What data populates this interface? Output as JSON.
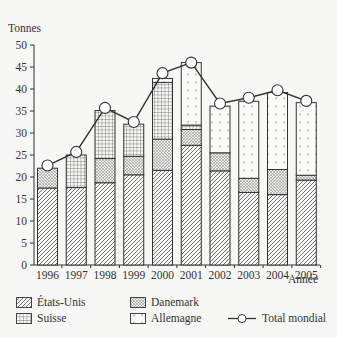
{
  "chart_data": {
    "type": "bar",
    "stacked": true,
    "title": "",
    "xlabel": "Année",
    "ylabel": "Tonnes",
    "ylim": [
      0,
      50
    ],
    "yticks": [
      0,
      5,
      10,
      15,
      20,
      25,
      30,
      35,
      40,
      45,
      50
    ],
    "grid": false,
    "legend_position": "bottom",
    "categories": [
      "1996",
      "1997",
      "1998",
      "1999",
      "2000",
      "2001",
      "2002",
      "2003",
      "2004",
      "2005"
    ],
    "series": [
      {
        "name": "États-Unis",
        "type": "bar",
        "pattern": "diagonal-hatch",
        "values": [
          17.5,
          17.6,
          18.7,
          20.5,
          21.5,
          27.2,
          21.4,
          16.5,
          16.0,
          19.3
        ]
      },
      {
        "name": "Danemark",
        "type": "bar",
        "pattern": "dots",
        "values": [
          4.5,
          0,
          5.5,
          4.2,
          7.1,
          3.6,
          4.1,
          3.2,
          5.7,
          1.1
        ]
      },
      {
        "name": "Suisse",
        "type": "bar",
        "pattern": "grid",
        "values": [
          0,
          7.4,
          10.9,
          7.3,
          12.9,
          1.0,
          0,
          0,
          0,
          0
        ]
      },
      {
        "name": "Allemagne",
        "type": "bar",
        "pattern": "sparse-dashes",
        "values": [
          0,
          0,
          0,
          0,
          0.9,
          14.2,
          10.6,
          17.5,
          17.5,
          16.5
        ]
      },
      {
        "name": "Total mondial",
        "type": "line",
        "marker": "circle",
        "values": [
          22.6,
          25.7,
          35.7,
          32.5,
          43.6,
          46.0,
          36.7,
          38.0,
          39.7,
          37.3
        ]
      }
    ]
  },
  "legend": {
    "items": [
      {
        "label": "États-Unis"
      },
      {
        "label": "Danemark"
      },
      {
        "label": "Suisse"
      },
      {
        "label": "Allemagne"
      },
      {
        "label": "Total mondial"
      }
    ]
  }
}
